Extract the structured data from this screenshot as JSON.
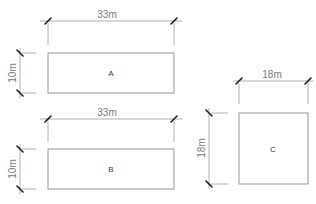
{
  "diagram": {
    "shapes": [
      {
        "id": "A",
        "label": "A",
        "width_label": "33m",
        "height_label": "10m",
        "rect": {
          "x": 48,
          "y": 53,
          "w": 126,
          "h": 40
        },
        "width_dim_y": 21,
        "height_dim_x": 20
      },
      {
        "id": "B",
        "label": "B",
        "width_label": "33m",
        "height_label": "10m",
        "rect": {
          "x": 48,
          "y": 149,
          "w": 126,
          "h": 40
        },
        "width_dim_y": 119,
        "height_dim_x": 20
      },
      {
        "id": "C",
        "label": "C",
        "width_label": "18m",
        "height_label": "18m",
        "rect": {
          "x": 239,
          "y": 113,
          "w": 69,
          "h": 71
        },
        "width_dim_y": 81,
        "height_dim_x": 209
      }
    ],
    "colors": {
      "outline": "#8a8a8a",
      "dimension_line": "#9a9a9a",
      "tick": "#1a1a1a",
      "text": "#7a7a7a"
    }
  }
}
